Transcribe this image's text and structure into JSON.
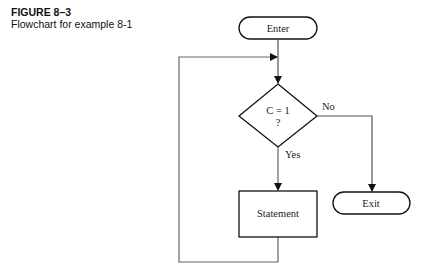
{
  "caption": {
    "figure_label": "FIGURE 8–3",
    "description": "Flowchart for example 8-1"
  },
  "flowchart": {
    "nodes": {
      "enter": {
        "label": "Enter",
        "shape": "terminal"
      },
      "decision": {
        "line1": "C = 1",
        "line2": "?",
        "shape": "diamond"
      },
      "statement": {
        "label": "Statement",
        "shape": "process"
      },
      "exit": {
        "label": "Exit",
        "shape": "terminal"
      }
    },
    "edges": {
      "no_label": "No",
      "yes_label": "Yes"
    }
  }
}
